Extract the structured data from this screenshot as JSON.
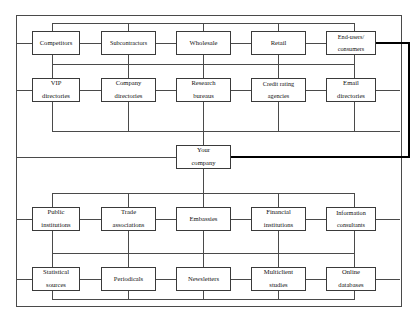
{
  "diagram": {
    "type": "network-flow-chart",
    "frame": {
      "x": 16,
      "y": 15,
      "width": 384,
      "height": 290
    },
    "colors": {
      "line": "#4a4a4a",
      "highlight": "#000000",
      "box_border": "#3a3a3a",
      "background": "#ffffff"
    },
    "center": {
      "label": "Your\ncompany",
      "line1": "Your",
      "line2": "company"
    },
    "rows": [
      {
        "id": "row-market-chain",
        "boxes": [
          {
            "id": "competitors",
            "line1": "Competitors",
            "line2": ""
          },
          {
            "id": "subcontractors",
            "line1": "Subcontractors",
            "line2": ""
          },
          {
            "id": "wholesale",
            "line1": "Wholesale",
            "line2": ""
          },
          {
            "id": "retail",
            "line1": "Retail",
            "line2": ""
          },
          {
            "id": "end-users-consumers",
            "line1": "End-users/",
            "line2": "consumers"
          }
        ]
      },
      {
        "id": "row-directories",
        "boxes": [
          {
            "id": "vip-directories",
            "line1": "VIP",
            "line2": "directories"
          },
          {
            "id": "company-directories",
            "line1": "Company",
            "line2": "directories"
          },
          {
            "id": "research-bureaus",
            "line1": "Research",
            "line2": "bureaus"
          },
          {
            "id": "credit-rating-agencies",
            "line1": "Credit rating",
            "line2": "agencies"
          },
          {
            "id": "email-directories",
            "line1": "Email",
            "line2": "directories"
          }
        ]
      },
      {
        "id": "row-institutions",
        "boxes": [
          {
            "id": "public-institutions",
            "line1": "Public",
            "line2": "institutions"
          },
          {
            "id": "trade-associations",
            "line1": "Trade",
            "line2": "associations"
          },
          {
            "id": "embassies",
            "line1": "Embassies",
            "line2": ""
          },
          {
            "id": "financial-institutions",
            "line1": "Financial",
            "line2": "institutions"
          },
          {
            "id": "information-consultants",
            "line1": "Information",
            "line2": "consultants"
          }
        ]
      },
      {
        "id": "row-publications",
        "boxes": [
          {
            "id": "statistical-sources",
            "line1": "Statistical",
            "line2": "sources"
          },
          {
            "id": "periodicals",
            "line1": "Periodicals",
            "line2": ""
          },
          {
            "id": "newsletters",
            "line1": "Newsletters",
            "line2": ""
          },
          {
            "id": "multiclient-studies",
            "line1": "Multiclient",
            "line2": "studies"
          },
          {
            "id": "online-databases",
            "line1": "Online",
            "line2": "databases"
          }
        ]
      }
    ],
    "highlight_path": {
      "from": "end-users-consumers",
      "to": "center",
      "description": "thick line from End-users/consumers right edge, right to outer margin, down, then left into Your company"
    }
  }
}
